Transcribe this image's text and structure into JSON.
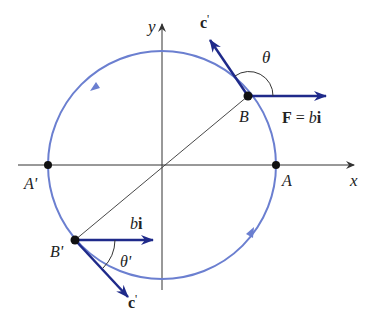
{
  "diagram": {
    "axes": {
      "x_label": "x",
      "y_label": "y"
    },
    "points": {
      "A": "A",
      "A_prime": "A'",
      "B": "B",
      "B_prime": "B'"
    },
    "vectors": {
      "force_label_F": "F",
      "force_label_eq": " = ",
      "force_label_b": "b",
      "force_label_i": "i",
      "bi_b": "b",
      "bi_i": "i",
      "c_prime_top": "c",
      "c_prime_top_prime": "'",
      "c_prime_bottom": "c",
      "c_prime_bottom_prime": "'"
    },
    "angles": {
      "theta": "θ",
      "theta_prime": "θ'"
    },
    "colors": {
      "circle": "#6b7fd0",
      "vector": "#1f2a8a",
      "axis": "#333333",
      "point": "#111111"
    }
  }
}
